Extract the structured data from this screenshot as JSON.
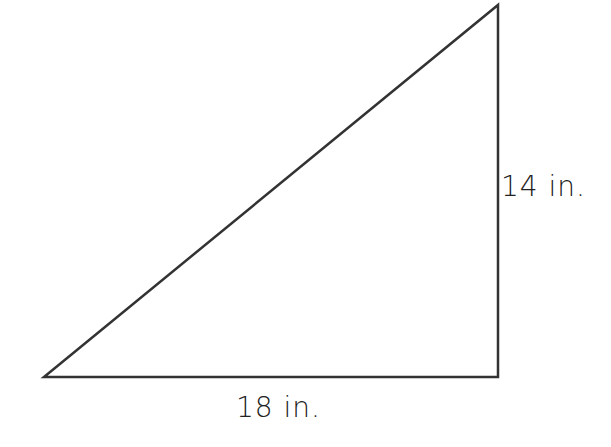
{
  "diagram": {
    "shape": "right-triangle",
    "stroke_color": "#333333",
    "vertices": {
      "bottom_left": [
        44,
        377
      ],
      "top_right": [
        498,
        5
      ],
      "bottom_right": [
        498,
        377
      ]
    },
    "labels": {
      "height": "14 in.",
      "base": "18 in."
    }
  }
}
